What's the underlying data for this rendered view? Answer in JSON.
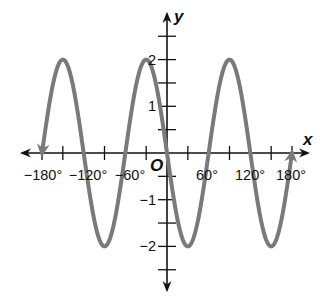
{
  "chart_data": {
    "type": "line",
    "title": "",
    "function": "y = -2 sin(3x)",
    "xlabel": "x",
    "ylabel": "y",
    "origin_label": "O",
    "xlim": [
      -180,
      180
    ],
    "ylim": [
      -2.5,
      2.5
    ],
    "grid": false,
    "x_units": "degrees",
    "x_tick_values": [
      -180,
      -150,
      -90,
      -30,
      30,
      90,
      150,
      180
    ],
    "x_tick_labels": [
      {
        "value": -180,
        "text": "−180°"
      },
      {
        "value": -120,
        "text": "−120°"
      },
      {
        "value": -60,
        "text": "−60°"
      },
      {
        "value": 60,
        "text": "60°"
      },
      {
        "value": 120,
        "text": "120°"
      },
      {
        "value": 180,
        "text": "180°"
      }
    ],
    "y_tick_values": [
      -2.5,
      -2,
      -1.5,
      -1,
      -0.5,
      0.5,
      1,
      1.5,
      2,
      2.5
    ],
    "y_tick_labels": [
      {
        "value": 2,
        "text": "2"
      },
      {
        "value": 1,
        "text": "1"
      },
      {
        "value": -1,
        "text": "−1"
      },
      {
        "value": -2,
        "text": "−2"
      }
    ],
    "series": [
      {
        "name": "y = -2 sin 3x",
        "color": "#7a7a7a",
        "amplitude": 2,
        "frequency": 3,
        "x": [
          -180,
          -150,
          -120,
          -90,
          -60,
          -30,
          0,
          30,
          60,
          90,
          120,
          150,
          180
        ],
        "values": [
          0,
          2,
          0,
          -2,
          0,
          2,
          0,
          -2,
          0,
          2,
          0,
          -2,
          0
        ],
        "start_arrow": "down",
        "end_arrow": "up"
      }
    ],
    "key_points": {
      "maxima": [
        [
          -150,
          2
        ],
        [
          -30,
          2
        ],
        [
          90,
          2
        ]
      ],
      "minima": [
        [
          -90,
          -2
        ],
        [
          30,
          -2
        ],
        [
          150,
          -2
        ]
      ],
      "zeros": [
        -180,
        -120,
        -60,
        0,
        60,
        120,
        180
      ]
    }
  },
  "colors": {
    "axis": "#111111",
    "curve": "#7a7a7a",
    "background": "#ffffff"
  }
}
